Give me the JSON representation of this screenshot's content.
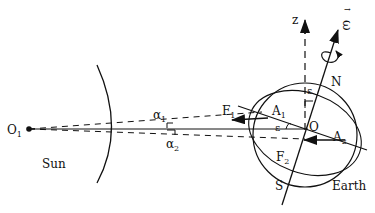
{
  "diagram": {
    "type": "physics-schematic",
    "labels": {
      "sun_center": "O",
      "sun_center_sub": "1",
      "sun": "Sun",
      "earth": "Earth",
      "earth_center": "O",
      "north": "N",
      "south": "S",
      "z_axis": "z",
      "omega": "ω",
      "omega_arrow": "→",
      "alpha1": "α",
      "alpha1_sub": "1",
      "alpha2": "α",
      "alpha2_sub": "2",
      "force1": "F",
      "force1_sub": "1",
      "force2": "F",
      "force2_sub": "2",
      "point_a1": "A",
      "point_a1_sub": "1",
      "point_a2": "A",
      "point_a2_sub": "2",
      "epsilon_top": "ε",
      "epsilon_side": "ε"
    },
    "colors": {
      "ink": "#111111",
      "background": "#ffffff"
    }
  }
}
